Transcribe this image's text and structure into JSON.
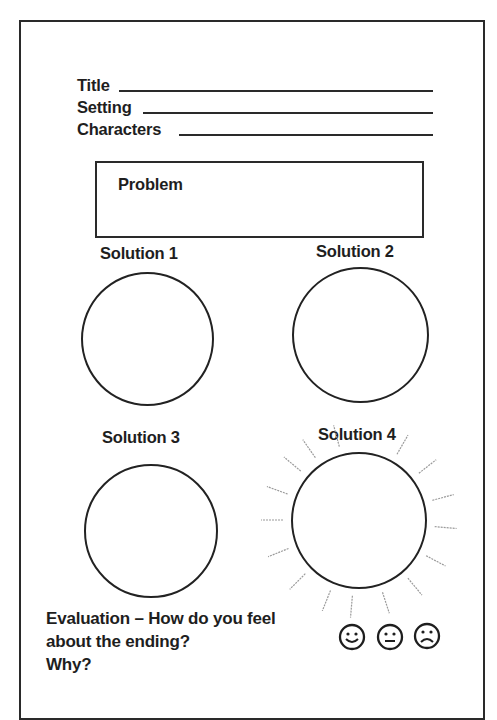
{
  "header_fields": [
    {
      "label": "Title"
    },
    {
      "label": "Setting"
    },
    {
      "label": "Characters"
    }
  ],
  "problem": {
    "label": "Problem"
  },
  "solutions": [
    {
      "label": "Solution 1"
    },
    {
      "label": "Solution 2"
    },
    {
      "label": "Solution 3"
    },
    {
      "label": "Solution 4"
    }
  ],
  "evaluation": {
    "line1": "Evaluation – How do you feel",
    "line2": "about the ending?",
    "line3": "Why?"
  },
  "feelings": [
    {
      "icon": "happy-face-icon",
      "glyph": "☺"
    },
    {
      "icon": "neutral-face-icon",
      "glyph": "😐"
    },
    {
      "icon": "sad-face-icon",
      "glyph": "☹"
    }
  ],
  "colors": {
    "ink": "#1e1e1e",
    "rays": "#9a9a9a",
    "paper": "#ffffff"
  }
}
